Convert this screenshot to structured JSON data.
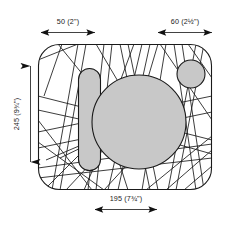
{
  "drawing": {
    "title": "Dimensioned outline drawing",
    "background_color": "#ffffff",
    "stroke_color": "#1a1a1a",
    "fill_gray": "#c8c8c8",
    "shapes": {
      "outline_name": "rounded-rectangle-outline",
      "pill_name": "rounded-pill-shape",
      "large_circle_name": "large-circle-shape",
      "small_circle_name": "small-circle-shape",
      "hatch_name": "crossing-line-pattern"
    }
  },
  "dimensions": {
    "top_left": {
      "label": "50 (2\")",
      "value_mm": 50,
      "value_in": "2\"",
      "orientation": "horizontal",
      "position": "top-left"
    },
    "top_right": {
      "label": "60 (2½\")",
      "value_mm": 60,
      "value_in": "2½\"",
      "orientation": "horizontal",
      "position": "top-right"
    },
    "bottom": {
      "label": "195 (7¾\")",
      "value_mm": 195,
      "value_in": "7¾\"",
      "orientation": "horizontal",
      "position": "bottom-center"
    },
    "left": {
      "label": "245 (9¾\")",
      "value_mm": 245,
      "value_in": "9¾\"",
      "orientation": "vertical",
      "position": "left-center"
    }
  }
}
